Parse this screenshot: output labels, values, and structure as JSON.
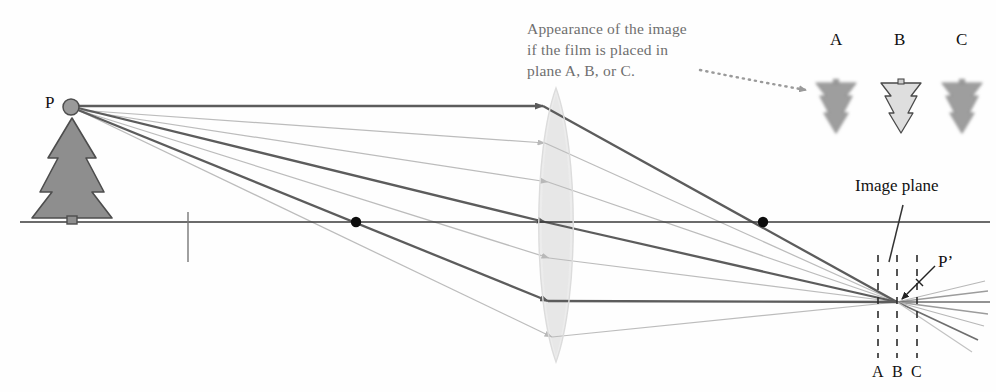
{
  "figure": {
    "type": "optics-ray-diagram"
  },
  "annotation": {
    "line1": "Appearance of the image",
    "line2": "if the film is placed in",
    "line3": "plane A, B, or C.",
    "pointer": "dotted-curved-arrow",
    "color": "#6f6f6f"
  },
  "object": {
    "point_label": "P",
    "shape": "evergreen-tree",
    "fill": "#8d8d8d",
    "stroke": "#4a4a4a"
  },
  "image": {
    "point_label": "P’",
    "plane_label": "Image plane"
  },
  "film_planes": {
    "labels_top": [
      "A",
      "B",
      "C"
    ],
    "labels_bottom": [
      "A",
      "B",
      "C"
    ],
    "focused_plane": "B",
    "dash_color": "#2b2b2b"
  },
  "previews": [
    {
      "label": "A",
      "state": "blurred"
    },
    {
      "label": "B",
      "state": "sharp"
    },
    {
      "label": "C",
      "state": "blurred"
    }
  ],
  "lens": {
    "name": "converging-lens",
    "fill": "#e9e9e9"
  },
  "axis": {
    "name": "optical-axis",
    "color": "#3a3a3a"
  },
  "focal_points": {
    "count": 2,
    "color": "#0d0d0d"
  },
  "rays": {
    "dark_color": "#5a5a5a",
    "light_color": "#b8b8b8",
    "count": 8
  }
}
